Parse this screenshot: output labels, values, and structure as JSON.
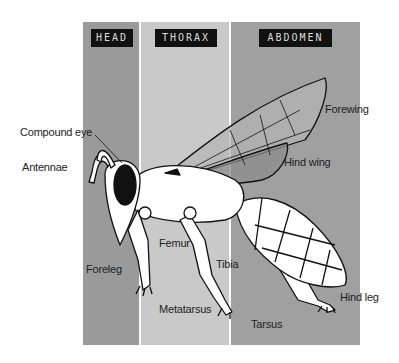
{
  "colors": {
    "head_band": "#9a9a9a",
    "thorax_band": "#c9c9c9",
    "abdomen_band": "#a0a0a0",
    "tag_bg": "#111111"
  },
  "regions": [
    {
      "id": "head",
      "label": "HEAD"
    },
    {
      "id": "thorax",
      "label": "THORAX"
    },
    {
      "id": "abdomen",
      "label": "ABDOMEN"
    }
  ],
  "labels": {
    "compound_eye": "Compound eye",
    "antennae": "Antennae",
    "forewing": "Forewing",
    "hind_wing": "Hind wing",
    "foreleg": "Foreleg",
    "femur": "Femur",
    "tibia": "Tibia",
    "metatarsus": "Metatarsus",
    "tarsus": "Tarsus",
    "hind_leg": "Hind leg"
  }
}
